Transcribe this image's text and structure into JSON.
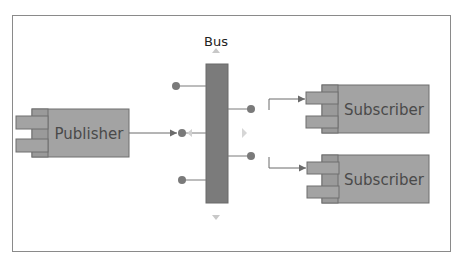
{
  "diagram": {
    "type": "publish-subscribe",
    "colors": {
      "component_fill": "#a3a3a3",
      "component_stroke": "#6e6e6e",
      "bus_fill": "#7b7b7b",
      "connector": "#6b6b6b",
      "dot": "#7a7a7a",
      "handle": "#c8c8c8",
      "text": "#4a4a4a",
      "frame": "#8a8a8a"
    },
    "bus": {
      "label": "Bus"
    },
    "publisher": {
      "label": "Publisher"
    },
    "subscribers": [
      {
        "label": "Subscriber"
      },
      {
        "label": "Subscriber"
      }
    ],
    "icons": {
      "bus_top_handle": "triangle-up-icon",
      "bus_bottom_handle": "triangle-down-icon",
      "bus_left_handle": "triangle-left-icon",
      "bus_right_handle": "triangle-right-icon"
    }
  }
}
